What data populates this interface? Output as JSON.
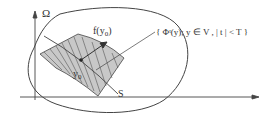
{
  "diagram": {
    "labels": {
      "omega": "Ω",
      "f_y0_f": "f(y",
      "f_y0_sub": "0",
      "f_y0_close": ")",
      "y0_y": "y",
      "y0_sub": "0",
      "s": "S",
      "flow_set": "{ Φᵗ(y); y ∈ V , | t | < T }"
    },
    "colors": {
      "stroke": "#444444",
      "region_fill": "#c8c8c8",
      "background": "#ffffff"
    }
  }
}
